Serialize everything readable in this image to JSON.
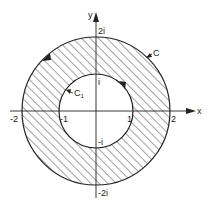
{
  "figure": {
    "axes": {
      "x_label": "x",
      "y_label": "y"
    },
    "ticks": {
      "x_neg2": "-2",
      "x_neg1": "-1",
      "x_pos1": "1",
      "x_pos2": "2",
      "y_pos2": "2i",
      "y_pos1": "i",
      "y_neg1": "-i",
      "y_neg2": "-2i"
    },
    "curves": {
      "outer": {
        "label": "C",
        "radius": 2,
        "orientation": "counterclockwise"
      },
      "inner": {
        "label": "C",
        "subscript": "1",
        "radius": 1,
        "orientation": "clockwise"
      }
    },
    "region": {
      "shading": "diagonal hatch",
      "between": "|z| = 1 and |z| = 2"
    },
    "colors": {
      "ink": "#222222",
      "background": "#ffffff"
    }
  }
}
